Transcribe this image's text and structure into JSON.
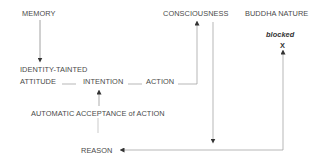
{
  "diagram": {
    "nodes": {
      "memory": "MEMORY",
      "consciousness": "CONSCIOUSNESS",
      "buddha_nature": "BUDDHA NATURE",
      "blocked": "blocked",
      "blocked_marker": "X",
      "identity_tainted": "IDENTITY-TAINTED",
      "attitude": "ATTITUDE",
      "intention": "INTENTION",
      "action": "ACTION",
      "automatic_acceptance": "AUTOMATIC ACCEPTANCE of ACTION",
      "reason": "REASON"
    },
    "edges": [
      {
        "from": "MEMORY",
        "to": "IDENTITY-TAINTED ATTITUDE",
        "arrow": true
      },
      {
        "from": "ATTITUDE",
        "to": "INTENTION",
        "arrow": false
      },
      {
        "from": "INTENTION",
        "to": "ACTION",
        "arrow": false
      },
      {
        "from": "ACTION",
        "to": "CONSCIOUSNESS",
        "arrow": true
      },
      {
        "from": "CONSCIOUSNESS",
        "to": "REASON",
        "arrow": true
      },
      {
        "from": "AUTOMATIC ACCEPTANCE of ACTION",
        "to": "INTENTION",
        "arrow": true
      },
      {
        "from": "AUTOMATIC ACCEPTANCE of ACTION",
        "to": "REASON",
        "arrow": false
      },
      {
        "from": "REASON",
        "to": "BUDDHA NATURE (blocked X)",
        "arrow": true
      }
    ],
    "colors": {
      "text": "#4a4a4a",
      "line": "#9a9a9a",
      "background": "#ffffff"
    }
  }
}
